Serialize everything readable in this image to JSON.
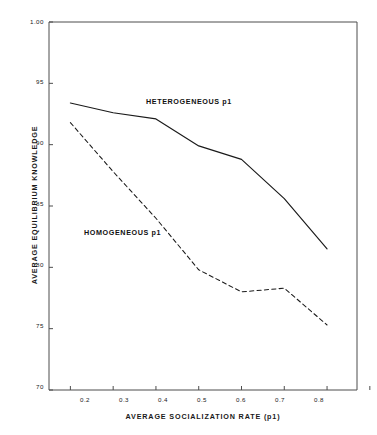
{
  "chart_data": {
    "type": "line",
    "title": "",
    "xlabel": "AVERAGE SOCIALIZATION RATE (p1)",
    "ylabel": "AVERAGE EQUILIBRIUM KNOWLEDGE",
    "x": [
      0.2,
      0.3,
      0.4,
      0.5,
      0.6,
      0.7,
      0.8
    ],
    "xlim": [
      0.15,
      0.87
    ],
    "ylim": [
      70,
      100
    ],
    "xticks": [
      "0.2",
      "0.3",
      "0.4",
      "0.5",
      "0.6",
      "0.7",
      "0.8"
    ],
    "xtick_values": [
      0.2,
      0.3,
      0.4,
      0.5,
      0.6,
      0.7,
      0.8
    ],
    "yticks": [
      "1.00",
      "95",
      "90",
      "85",
      "80",
      "75",
      "70"
    ],
    "ytick_values": [
      100,
      95,
      90,
      85,
      80,
      75,
      70
    ],
    "grid": false,
    "legend_position": "inline-annotation",
    "series": [
      {
        "name": "HETEROGENEOUS p1",
        "style": "solid",
        "color": "#1a1a1a",
        "values": [
          93.4,
          92.6,
          92.1,
          89.9,
          88.8,
          85.6,
          81.5
        ]
      },
      {
        "name": "HOMOGENEOUS p1",
        "style": "dashed",
        "color": "#1a1a1a",
        "values": [
          91.8,
          87.8,
          84.0,
          79.8,
          78.0,
          78.3,
          75.3
        ]
      }
    ],
    "annotations": [
      {
        "text": "HETEROGENEOUS p1",
        "x": 0.44,
        "y": 93.2
      },
      {
        "text": "HOMOGENEOUS p1",
        "x": 0.27,
        "y": 82.6
      }
    ],
    "axis_color": "#4d4d4d",
    "background": "#ffffff"
  }
}
